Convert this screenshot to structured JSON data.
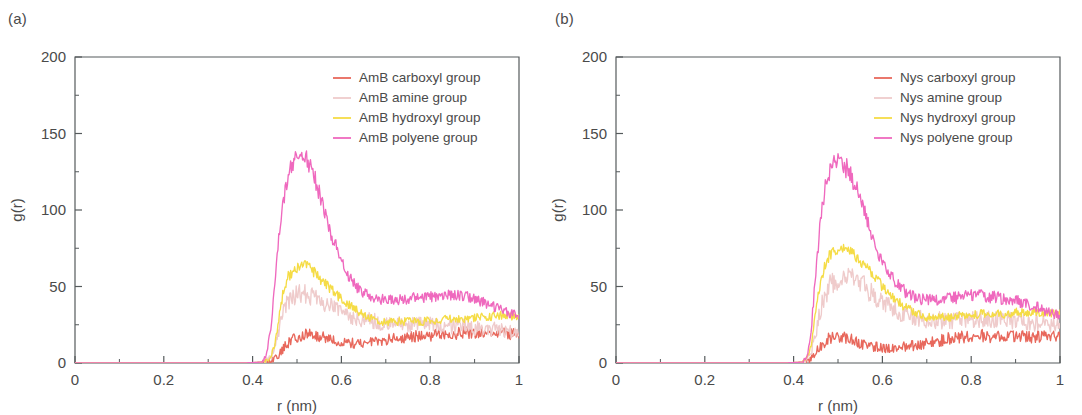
{
  "figure": {
    "panels": [
      {
        "id": "a",
        "label": "(a)",
        "legend": [
          {
            "label": "AmB carboxyl group",
            "color": "#E8685C"
          },
          {
            "label": "AmB amine group",
            "color": "#EFCBCB"
          },
          {
            "label": "AmB hydroxyl group",
            "color": "#F5DC46"
          },
          {
            "label": "AmB polyene group",
            "color": "#EF69BE"
          }
        ],
        "chart_data": {
          "type": "line",
          "title": "",
          "xlabel": "r (nm)",
          "ylabel": "g(r)",
          "xlim": [
            0,
            1
          ],
          "ylim": [
            0,
            200
          ],
          "xticks": [
            0,
            0.2,
            0.4,
            0.6,
            0.8,
            1
          ],
          "xticklabels": [
            "0",
            "0.2",
            "0.4",
            "0.6",
            "0.8",
            "1"
          ],
          "yticks": [
            0,
            50,
            100,
            150,
            200
          ],
          "yticklabels": [
            "0",
            "50",
            "100",
            "150",
            "200"
          ],
          "xminor_step": 0.1,
          "yminor_step": 25,
          "grid": false,
          "legend_position": "top-right",
          "noise": 1.6,
          "series": [
            {
              "name": "AmB carboxyl group",
              "color": "#E8685C",
              "noise": 2.2,
              "x": [
                0.0,
                0.1,
                0.2,
                0.3,
                0.38,
                0.42,
                0.44,
                0.45,
                0.46,
                0.47,
                0.48,
                0.5,
                0.52,
                0.54,
                0.56,
                0.58,
                0.6,
                0.62,
                0.64,
                0.66,
                0.68,
                0.7,
                0.72,
                0.75,
                0.78,
                0.8,
                0.82,
                0.85,
                0.88,
                0.9,
                0.92,
                0.95,
                0.98,
                1.0
              ],
              "y": [
                0,
                0,
                0,
                0,
                0,
                0.4,
                1.5,
                3,
                6,
                10,
                13,
                17,
                19,
                18,
                17,
                15,
                14,
                13,
                13,
                13,
                14,
                15,
                16,
                17,
                18,
                18,
                19,
                19,
                20,
                20,
                20,
                20,
                19,
                19
              ]
            },
            {
              "name": "AmB amine group",
              "color": "#EFCBCB",
              "noise": 2.6,
              "x": [
                0.0,
                0.1,
                0.2,
                0.3,
                0.38,
                0.42,
                0.44,
                0.45,
                0.46,
                0.47,
                0.48,
                0.5,
                0.51,
                0.52,
                0.54,
                0.56,
                0.58,
                0.6,
                0.62,
                0.64,
                0.66,
                0.68,
                0.7,
                0.72,
                0.75,
                0.78,
                0.8,
                0.82,
                0.85,
                0.88,
                0.9,
                0.92,
                0.95,
                0.98,
                1.0
              ],
              "y": [
                0,
                0,
                0,
                0,
                0,
                0.5,
                3,
                10,
                22,
                33,
                40,
                45,
                46,
                45,
                42,
                39,
                36,
                33,
                31,
                29,
                28,
                27,
                26,
                26,
                25,
                25,
                25,
                25,
                24,
                24,
                23,
                23,
                22,
                21,
                20
              ]
            },
            {
              "name": "AmB hydroxyl group",
              "color": "#F5DC46",
              "noise": 1.4,
              "x": [
                0.0,
                0.1,
                0.2,
                0.3,
                0.38,
                0.42,
                0.44,
                0.45,
                0.46,
                0.47,
                0.48,
                0.5,
                0.51,
                0.52,
                0.53,
                0.54,
                0.56,
                0.58,
                0.6,
                0.62,
                0.64,
                0.66,
                0.68,
                0.7,
                0.72,
                0.75,
                0.78,
                0.8,
                0.82,
                0.85,
                0.88,
                0.9,
                0.92,
                0.95,
                0.98,
                1.0
              ],
              "y": [
                0,
                0,
                0,
                0,
                0,
                0.5,
                3,
                12,
                30,
                48,
                57,
                62,
                64,
                64,
                62,
                59,
                53,
                47,
                42,
                37,
                33,
                30,
                28,
                27,
                27,
                27,
                27,
                28,
                28,
                29,
                29,
                30,
                30,
                31,
                31,
                31
              ]
            },
            {
              "name": "AmB polyene group",
              "color": "#EF69BE",
              "noise": 1.5,
              "x": [
                0.0,
                0.1,
                0.2,
                0.3,
                0.38,
                0.42,
                0.43,
                0.44,
                0.45,
                0.46,
                0.47,
                0.48,
                0.49,
                0.5,
                0.51,
                0.52,
                0.53,
                0.54,
                0.55,
                0.56,
                0.58,
                0.6,
                0.62,
                0.64,
                0.66,
                0.68,
                0.7,
                0.72,
                0.75,
                0.78,
                0.8,
                0.82,
                0.85,
                0.88,
                0.9,
                0.92,
                0.95,
                0.98,
                1.0
              ],
              "y": [
                0,
                0,
                0,
                0,
                0,
                0.6,
                4,
                20,
                52,
                84,
                108,
                122,
                130,
                134,
                136,
                134,
                129,
                121,
                111,
                100,
                82,
                66,
                55,
                48,
                44,
                42,
                41,
                41,
                42,
                43,
                43,
                44,
                44,
                44,
                42,
                40,
                36,
                32,
                31
              ]
            }
          ]
        }
      },
      {
        "id": "b",
        "label": "(b)",
        "legend": [
          {
            "label": "Nys carboxyl group",
            "color": "#E8685C"
          },
          {
            "label": "Nys amine group",
            "color": "#EFCBCB"
          },
          {
            "label": "Nys hydroxyl group",
            "color": "#F5DC46"
          },
          {
            "label": "Nys polyene group",
            "color": "#EF69BE"
          }
        ],
        "chart_data": {
          "type": "line",
          "title": "",
          "xlabel": "r (nm)",
          "ylabel": "g(r)",
          "xlim": [
            0,
            1
          ],
          "ylim": [
            0,
            200
          ],
          "xticks": [
            0,
            0.2,
            0.4,
            0.6,
            0.8,
            1
          ],
          "xticklabels": [
            "0",
            "0.2",
            "0.4",
            "0.6",
            "0.8",
            "1"
          ],
          "yticks": [
            0,
            50,
            100,
            150,
            200
          ],
          "yticklabels": [
            "0",
            "50",
            "100",
            "150",
            "200"
          ],
          "xminor_step": 0.1,
          "yminor_step": 25,
          "grid": false,
          "legend_position": "top-right",
          "noise": 1.6,
          "series": [
            {
              "name": "Nys carboxyl group",
              "color": "#E8685C",
              "noise": 2.4,
              "x": [
                0.0,
                0.1,
                0.2,
                0.3,
                0.38,
                0.42,
                0.43,
                0.44,
                0.45,
                0.46,
                0.47,
                0.48,
                0.5,
                0.52,
                0.54,
                0.56,
                0.58,
                0.6,
                0.62,
                0.64,
                0.66,
                0.68,
                0.7,
                0.72,
                0.75,
                0.78,
                0.8,
                0.82,
                0.85,
                0.88,
                0.9,
                0.92,
                0.95,
                0.98,
                1.0
              ],
              "y": [
                0,
                0,
                0,
                0,
                0,
                0.4,
                1,
                3,
                7,
                11,
                14,
                16,
                17,
                16,
                14,
                12,
                11,
                10,
                10,
                10,
                11,
                12,
                13,
                14,
                16,
                17,
                18,
                18,
                17,
                17,
                17,
                17,
                17,
                17,
                17
              ]
            },
            {
              "name": "Nys amine group",
              "color": "#EFCBCB",
              "noise": 2.8,
              "x": [
                0.0,
                0.1,
                0.2,
                0.3,
                0.38,
                0.42,
                0.43,
                0.44,
                0.45,
                0.46,
                0.47,
                0.48,
                0.5,
                0.51,
                0.52,
                0.53,
                0.54,
                0.56,
                0.58,
                0.6,
                0.62,
                0.64,
                0.66,
                0.68,
                0.7,
                0.72,
                0.75,
                0.78,
                0.8,
                0.82,
                0.85,
                0.88,
                0.9,
                0.92,
                0.95,
                0.98,
                1.0
              ],
              "y": [
                0,
                0,
                0,
                0,
                0,
                0.5,
                2,
                8,
                20,
                34,
                44,
                50,
                55,
                56,
                57,
                56,
                54,
                50,
                45,
                40,
                36,
                33,
                31,
                29,
                28,
                28,
                28,
                28,
                29,
                29,
                29,
                28,
                28,
                27,
                26,
                25,
                24
              ]
            },
            {
              "name": "Nys hydroxyl group",
              "color": "#F5DC46",
              "noise": 1.3,
              "x": [
                0.0,
                0.1,
                0.2,
                0.3,
                0.38,
                0.42,
                0.43,
                0.44,
                0.45,
                0.46,
                0.47,
                0.48,
                0.5,
                0.51,
                0.52,
                0.53,
                0.54,
                0.56,
                0.58,
                0.6,
                0.62,
                0.64,
                0.66,
                0.68,
                0.7,
                0.72,
                0.75,
                0.78,
                0.8,
                0.82,
                0.85,
                0.88,
                0.9,
                0.92,
                0.95,
                0.98,
                1.0
              ],
              "y": [
                0,
                0,
                0,
                0,
                0,
                0.6,
                3,
                13,
                33,
                52,
                64,
                70,
                74,
                75,
                75,
                73,
                70,
                64,
                57,
                50,
                44,
                39,
                35,
                32,
                30,
                30,
                30,
                31,
                31,
                32,
                32,
                32,
                33,
                33,
                33,
                32,
                32
              ]
            },
            {
              "name": "Nys polyene group",
              "color": "#EF69BE",
              "noise": 1.7,
              "x": [
                0.0,
                0.1,
                0.2,
                0.3,
                0.38,
                0.42,
                0.43,
                0.44,
                0.45,
                0.46,
                0.47,
                0.48,
                0.49,
                0.5,
                0.51,
                0.52,
                0.53,
                0.54,
                0.55,
                0.56,
                0.58,
                0.6,
                0.62,
                0.64,
                0.66,
                0.68,
                0.7,
                0.72,
                0.75,
                0.78,
                0.8,
                0.82,
                0.85,
                0.88,
                0.9,
                0.92,
                0.95,
                0.98,
                1.0
              ],
              "y": [
                0,
                0,
                0,
                0,
                0,
                0.6,
                4,
                22,
                58,
                92,
                113,
                124,
                129,
                131,
                130,
                127,
                122,
                115,
                107,
                98,
                81,
                66,
                56,
                49,
                45,
                42,
                41,
                41,
                42,
                43,
                44,
                44,
                43,
                42,
                41,
                39,
                36,
                33,
                32
              ]
            }
          ]
        }
      }
    ]
  }
}
